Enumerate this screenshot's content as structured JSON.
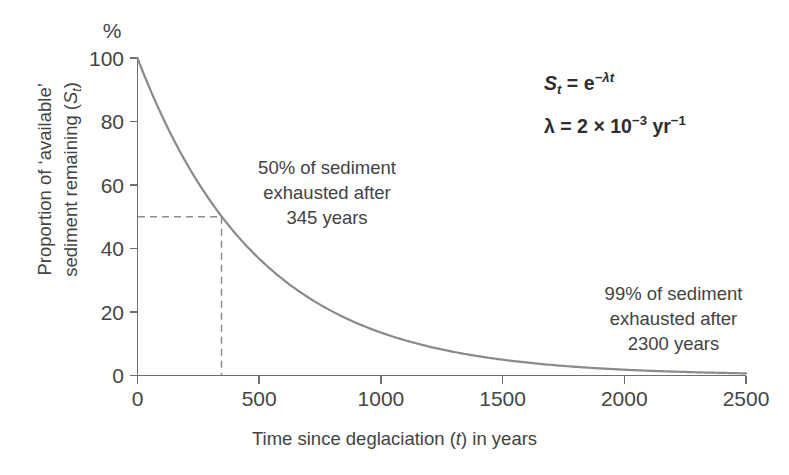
{
  "chart_data": {
    "type": "line",
    "title": "",
    "xlabel": "Time since deglaciation (t) in years",
    "ylabel": "Proportion of 'available' sediment remaining (St)",
    "ylabel_line1": "Proportion of ‘available’",
    "ylabel_line2_prefix": "sediment remaining (",
    "ylabel_line2_sym": "S",
    "ylabel_line2_sub": "t",
    "ylabel_line2_suffix": ")",
    "y_unit_label": "%",
    "xlim": [
      0,
      2500
    ],
    "ylim": [
      0,
      100
    ],
    "xticks": [
      "0",
      "500",
      "1000",
      "1500",
      "2000",
      "2500"
    ],
    "xtick_values": [
      0,
      500,
      1000,
      1500,
      2000,
      2500
    ],
    "yticks": [
      "0",
      "20",
      "40",
      "60",
      "80",
      "100"
    ],
    "ytick_values": [
      0,
      20,
      40,
      60,
      80,
      100
    ],
    "grid": false,
    "legend": "none",
    "series": [
      {
        "name": "St = e^(-lambda t)",
        "decay_constant": 0.002,
        "x": [
          0,
          100,
          200,
          300,
          345,
          400,
          500,
          600,
          700,
          800,
          900,
          1000,
          1100,
          1200,
          1300,
          1400,
          1500,
          1600,
          1700,
          1800,
          1900,
          2000,
          2100,
          2200,
          2300,
          2400,
          2500
        ],
        "y": [
          100.0,
          81.9,
          67.0,
          54.9,
          50.1,
          44.9,
          36.8,
          30.1,
          24.7,
          20.2,
          16.5,
          13.5,
          11.1,
          9.1,
          7.4,
          6.1,
          5.0,
          4.1,
          3.3,
          2.7,
          2.2,
          1.8,
          1.5,
          1.2,
          1.0,
          0.8,
          0.7
        ]
      }
    ],
    "guide_lines": [
      {
        "name": "half-life-horizontal",
        "from": [
          0,
          50
        ],
        "to": [
          345,
          50
        ],
        "style": "dashed"
      },
      {
        "name": "half-life-vertical",
        "from": [
          345,
          50
        ],
        "to": [
          345,
          0
        ],
        "style": "dashed"
      }
    ],
    "annotations": [
      {
        "name": "annotation-50-percent",
        "lines": [
          "50% of sediment",
          "exhausted after",
          "345 years"
        ],
        "value_percent": 50,
        "value_years": 345
      },
      {
        "name": "annotation-99-percent",
        "lines": [
          "99% of sediment",
          "exhausted after",
          "2300 years"
        ],
        "value_percent": 99,
        "value_years": 2300
      }
    ],
    "formulas": {
      "line1": {
        "lhs_sym": "S",
        "lhs_sub": "t",
        "eq": "=",
        "rhs_base": "e",
        "rhs_exp": "−λt"
      },
      "line2": {
        "lhs": "λ",
        "eq": "=",
        "coef": "2",
        "times": "×",
        "base": "10",
        "exp": "−3",
        "unit": "yr",
        "unit_exp": "−1"
      }
    },
    "colors": {
      "curve": "#8a8a8a",
      "axis": "#6f6f6f",
      "guide": "#8d8d8d",
      "text": "#434343",
      "background": "#ffffff"
    }
  }
}
